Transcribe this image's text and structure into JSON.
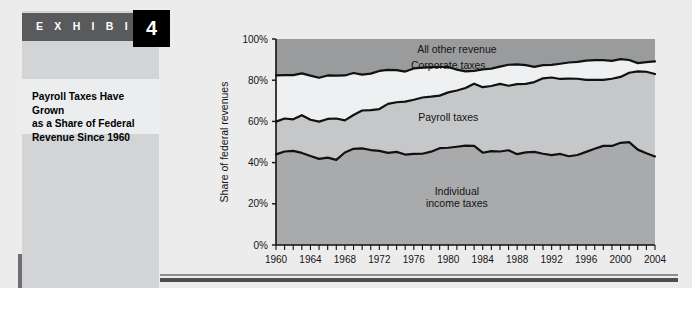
{
  "exhibit": {
    "label": "E X H I B I T",
    "number": "4",
    "title": "Payroll Taxes Have Grown\nas a Share of Federal\nRevenue Since 1960"
  },
  "colors": {
    "paper": "#ececed",
    "panel": "#d3d4d6",
    "panel_title_band": "#ecedee",
    "exhibit_bar": "#595a5c",
    "exhibit_number_box": "#000000",
    "band_individual": "#a9aaac",
    "band_payroll": "#c6c7c9",
    "band_corporate": "#eef0f1",
    "band_other": "#9a9b9d",
    "line": "#111111",
    "axis": "#111111",
    "shadow": "#6f6f71"
  },
  "chart_data": {
    "type": "area",
    "title": "",
    "xlabel": "",
    "ylabel": "Share of federal revenues",
    "xlim": [
      1960,
      2004
    ],
    "ylim": [
      0,
      100
    ],
    "grid": false,
    "legend": "inline-annotations",
    "ytick_labels": [
      "0%",
      "20%",
      "40%",
      "60%",
      "80%",
      "100%"
    ],
    "ytick_values": [
      0,
      20,
      40,
      60,
      80,
      100
    ],
    "xtick_labels": [
      "1960",
      "1964",
      "1968",
      "1972",
      "1976",
      "1980",
      "1984",
      "1988",
      "1992",
      "1996",
      "2000",
      "2004"
    ],
    "xtick_values": [
      1960,
      1964,
      1968,
      1972,
      1976,
      1980,
      1984,
      1988,
      1992,
      1996,
      2000,
      2004
    ],
    "xminor_step": 1,
    "annotations": [
      {
        "text": "All other revenue",
        "x": 1981,
        "y": 95
      },
      {
        "text": "Corporate taxes",
        "x": 1980,
        "y": 87
      },
      {
        "text": "Payroll taxes",
        "x": 1980,
        "y": 62
      },
      {
        "text": "Individual",
        "x": 1981,
        "y": 26
      },
      {
        "text": "income taxes",
        "x": 1981,
        "y": 20
      }
    ],
    "x": [
      1960,
      1961,
      1962,
      1963,
      1964,
      1965,
      1966,
      1967,
      1968,
      1969,
      1970,
      1971,
      1972,
      1973,
      1974,
      1975,
      1976,
      1977,
      1978,
      1979,
      1980,
      1981,
      1982,
      1983,
      1984,
      1985,
      1986,
      1987,
      1988,
      1989,
      1990,
      1991,
      1992,
      1993,
      1994,
      1995,
      1996,
      1997,
      1998,
      1999,
      2000,
      2001,
      2002,
      2003,
      2004
    ],
    "series": [
      {
        "name": "Individual income taxes",
        "cumulative_top": [
          44.0,
          45.4,
          45.7,
          44.7,
          43.2,
          41.8,
          42.4,
          41.3,
          44.9,
          46.7,
          46.9,
          46.1,
          45.7,
          44.7,
          45.2,
          43.9,
          44.2,
          44.3,
          45.3,
          47.0,
          47.2,
          47.7,
          48.2,
          48.1,
          44.8,
          45.6,
          45.4,
          46.0,
          44.1,
          45.0,
          45.2,
          44.3,
          43.6,
          44.2,
          43.1,
          43.7,
          45.2,
          46.7,
          48.1,
          48.1,
          49.6,
          49.9,
          46.3,
          44.5,
          43.0
        ]
      },
      {
        "name": "Payroll taxes",
        "cumulative_top": [
          59.9,
          61.4,
          61.0,
          63.0,
          60.8,
          59.9,
          61.2,
          61.4,
          60.5,
          63.1,
          65.3,
          65.5,
          66.0,
          68.5,
          69.3,
          69.6,
          70.5,
          71.6,
          72.0,
          72.5,
          74.1,
          75.0,
          76.2,
          78.3,
          76.6,
          77.2,
          78.2,
          77.3,
          78.1,
          78.2,
          79.1,
          80.9,
          81.3,
          80.6,
          80.8,
          80.7,
          80.2,
          80.2,
          80.2,
          80.7,
          81.6,
          83.6,
          84.3,
          84.1,
          83.0
        ]
      },
      {
        "name": "Corporate taxes",
        "cumulative_top": [
          82.3,
          82.5,
          82.5,
          83.3,
          82.2,
          81.2,
          82.3,
          82.2,
          82.3,
          83.5,
          82.7,
          83.2,
          84.5,
          85.0,
          84.9,
          84.2,
          85.7,
          86.1,
          86.3,
          86.4,
          86.4,
          85.1,
          84.3,
          84.5,
          85.2,
          85.6,
          86.6,
          87.5,
          87.7,
          87.3,
          86.5,
          87.3,
          87.4,
          88.0,
          88.6,
          88.9,
          89.5,
          89.7,
          89.7,
          89.4,
          90.2,
          89.8,
          88.3,
          88.8,
          89.1
        ]
      },
      {
        "name": "All other revenue",
        "cumulative_top": [
          100,
          100,
          100,
          100,
          100,
          100,
          100,
          100,
          100,
          100,
          100,
          100,
          100,
          100,
          100,
          100,
          100,
          100,
          100,
          100,
          100,
          100,
          100,
          100,
          100,
          100,
          100,
          100,
          100,
          100,
          100,
          100,
          100,
          100,
          100,
          100,
          100,
          100,
          100,
          100,
          100,
          100,
          100,
          100,
          100
        ]
      }
    ]
  }
}
